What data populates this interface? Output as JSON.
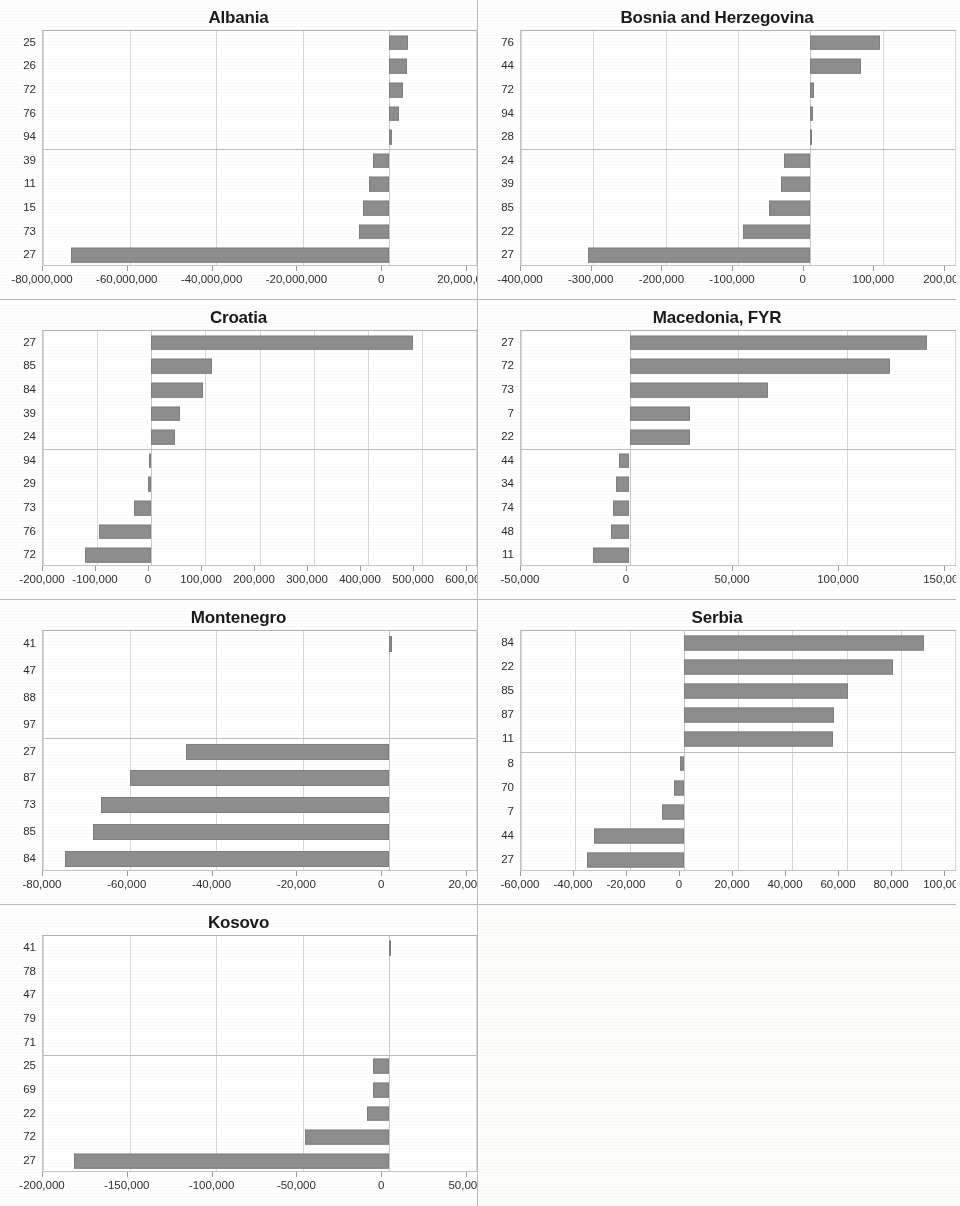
{
  "document": {
    "kind": "scanned-figure-sheet",
    "panel_columns": 2,
    "panel_rows": 4,
    "bar_color": "#8e8e8e",
    "gridline_color": "#d8d8d8",
    "text_color": "#2b2b2b"
  },
  "chart_data": [
    {
      "type": "bar",
      "orientation": "horizontal",
      "title": "Albania",
      "xlabel": "",
      "ylabel": "",
      "grid": true,
      "legend": "none",
      "xlim": [
        -80000000,
        20000000
      ],
      "xticks": [
        -80000000,
        -60000000,
        -40000000,
        -20000000,
        0,
        20000000
      ],
      "xtick_labels": [
        "-80,000,000",
        "-60,000,000",
        "-40,000,000",
        "-20,000,000",
        "0",
        "20,000,000"
      ],
      "categories": [
        "25",
        "26",
        "72",
        "76",
        "94",
        "39",
        "11",
        "15",
        "73",
        "27"
      ],
      "values": [
        4200000,
        4100000,
        3100000,
        2300000,
        700000,
        -3800000,
        -4600000,
        -6100000,
        -7100000,
        -73500000
      ]
    },
    {
      "type": "bar",
      "orientation": "horizontal",
      "title": "Bosnia and Herzegovina",
      "xlabel": "",
      "ylabel": "",
      "grid": true,
      "legend": "none",
      "xlim": [
        -400000,
        200000
      ],
      "xticks": [
        -400000,
        -300000,
        -200000,
        -100000,
        0,
        100000,
        200000
      ],
      "xtick_labels": [
        "-400,000",
        "-300,000",
        "-200,000",
        "-100,000",
        "0",
        "100,000",
        "200,000"
      ],
      "categories": [
        "76",
        "44",
        "72",
        "94",
        "28",
        "24",
        "39",
        "85",
        "22",
        "27"
      ],
      "values": [
        96000,
        70000,
        5000,
        4000,
        2500,
        -36000,
        -41000,
        -57000,
        -93000,
        -308000
      ]
    },
    {
      "type": "bar",
      "orientation": "horizontal",
      "title": "Croatia",
      "xlabel": "",
      "ylabel": "",
      "grid": true,
      "legend": "none",
      "xlim": [
        -200000,
        600000
      ],
      "xticks": [
        -200000,
        -100000,
        0,
        100000,
        200000,
        300000,
        400000,
        500000,
        600000
      ],
      "xtick_labels": [
        "-200,000",
        "-100,000",
        "0",
        "100,000",
        "200,000",
        "300,000",
        "400,000",
        "500,000",
        "600,000"
      ],
      "categories": [
        "27",
        "85",
        "84",
        "39",
        "24",
        "94",
        "29",
        "73",
        "76",
        "72"
      ],
      "values": [
        484000,
        112000,
        96000,
        53000,
        44000,
        -4000,
        -6000,
        -31000,
        -97000,
        -122000
      ]
    },
    {
      "type": "bar",
      "orientation": "horizontal",
      "title": "Macedonia, FYR",
      "xlabel": "",
      "ylabel": "",
      "grid": true,
      "legend": "none",
      "xlim": [
        -50000,
        150000
      ],
      "xticks": [
        -50000,
        0,
        50000,
        100000,
        150000
      ],
      "xtick_labels": [
        "-50,000",
        "0",
        "50,000",
        "100,000",
        "150,000"
      ],
      "categories": [
        "27",
        "72",
        "73",
        "7",
        "22",
        "44",
        "34",
        "74",
        "48",
        "11"
      ],
      "values": [
        137000,
        120000,
        64000,
        28000,
        28000,
        -5000,
        -6000,
        -7500,
        -8500,
        -17000
      ]
    },
    {
      "type": "bar",
      "orientation": "horizontal",
      "title": "Montenegro",
      "xlabel": "",
      "ylabel": "",
      "grid": true,
      "legend": "none",
      "xlim": [
        -80000,
        20000
      ],
      "xticks": [
        -80000,
        -60000,
        -40000,
        -20000,
        0,
        20000
      ],
      "xtick_labels": [
        "-80,000",
        "-60,000",
        "-40,000",
        "-20,000",
        "0",
        "20,000"
      ],
      "categories": [
        "41",
        "47",
        "88",
        "97",
        "27",
        "87",
        "73",
        "85",
        "84"
      ],
      "values": [
        600,
        0,
        0,
        0,
        -47000,
        -60000,
        -66500,
        -68500,
        -75000
      ]
    },
    {
      "type": "bar",
      "orientation": "horizontal",
      "title": "Serbia",
      "xlabel": "",
      "ylabel": "",
      "grid": true,
      "legend": "none",
      "xlim": [
        -60000,
        100000
      ],
      "xticks": [
        -60000,
        -40000,
        -20000,
        0,
        20000,
        40000,
        60000,
        80000,
        100000
      ],
      "xtick_labels": [
        "-60,000",
        "-40,000",
        "-20,000",
        "0",
        "20,000",
        "40,000",
        "60,000",
        "80,000",
        "100,000"
      ],
      "categories": [
        "84",
        "22",
        "85",
        "87",
        "11",
        "8",
        "70",
        "7",
        "44",
        "27"
      ],
      "values": [
        88500,
        77000,
        60500,
        55500,
        55000,
        -1500,
        -3500,
        -8000,
        -33000,
        -35500
      ]
    },
    {
      "type": "bar",
      "orientation": "horizontal",
      "title": "Kosovo",
      "xlabel": "",
      "ylabel": "",
      "grid": true,
      "legend": "none",
      "xlim": [
        -200000,
        50000
      ],
      "xticks": [
        -200000,
        -150000,
        -100000,
        -50000,
        0,
        50000
      ],
      "xtick_labels": [
        "-200,000",
        "-150,000",
        "-100,000",
        "-50,000",
        "0",
        "50,000"
      ],
      "categories": [
        "41",
        "78",
        "47",
        "79",
        "71",
        "25",
        "69",
        "22",
        "72",
        "27"
      ],
      "values": [
        800,
        0,
        0,
        0,
        0,
        -9500,
        -9500,
        -13000,
        -49000,
        -182000
      ]
    }
  ]
}
